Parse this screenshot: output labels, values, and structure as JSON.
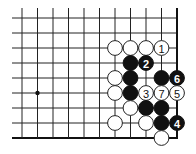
{
  "diagram": {
    "type": "go-board-fragment",
    "grid": {
      "columns": 11,
      "rows": 9,
      "origin_x": 22,
      "origin_y": 18,
      "spacing_x": 15.5,
      "spacing_y": 15,
      "line_top_extend": 10,
      "line_left_extend": 10,
      "right_edge": true,
      "bottom_edge": true
    },
    "star_points": [
      {
        "col": 1,
        "row": 5
      }
    ],
    "stones": [
      {
        "col": 6,
        "row": 2,
        "color": "white",
        "label": ""
      },
      {
        "col": 7,
        "row": 2,
        "color": "white",
        "label": ""
      },
      {
        "col": 8,
        "row": 2,
        "color": "white",
        "label": ""
      },
      {
        "col": 9,
        "row": 2,
        "color": "white",
        "label": "1"
      },
      {
        "col": 7,
        "row": 3,
        "color": "black",
        "label": ""
      },
      {
        "col": 8,
        "row": 3,
        "color": "black",
        "label": "2"
      },
      {
        "col": 6,
        "row": 4,
        "color": "white",
        "label": ""
      },
      {
        "col": 7,
        "row": 4,
        "color": "black",
        "label": ""
      },
      {
        "col": 9,
        "row": 4,
        "color": "black",
        "label": ""
      },
      {
        "col": 10,
        "row": 4,
        "color": "black",
        "label": "6"
      },
      {
        "col": 6,
        "row": 5,
        "color": "white",
        "label": ""
      },
      {
        "col": 7,
        "row": 5,
        "color": "black",
        "label": ""
      },
      {
        "col": 8,
        "row": 5,
        "color": "white",
        "label": "3"
      },
      {
        "col": 9,
        "row": 5,
        "color": "white",
        "label": "7"
      },
      {
        "col": 10,
        "row": 5,
        "color": "white",
        "label": "5"
      },
      {
        "col": 7,
        "row": 6,
        "color": "white",
        "label": ""
      },
      {
        "col": 8,
        "row": 6,
        "color": "black",
        "label": ""
      },
      {
        "col": 9,
        "row": 6,
        "color": "black",
        "label": ""
      },
      {
        "col": 6,
        "row": 7,
        "color": "white",
        "label": ""
      },
      {
        "col": 8,
        "row": 7,
        "color": "white",
        "label": ""
      },
      {
        "col": 9,
        "row": 7,
        "color": "black",
        "label": ""
      },
      {
        "col": 10,
        "row": 7,
        "color": "black",
        "label": "4"
      },
      {
        "col": 9,
        "row": 8,
        "color": "white",
        "label": ""
      }
    ],
    "colors": {
      "black_stone": "#111111",
      "white_stone": "#ffffff",
      "line": "#222222"
    }
  }
}
